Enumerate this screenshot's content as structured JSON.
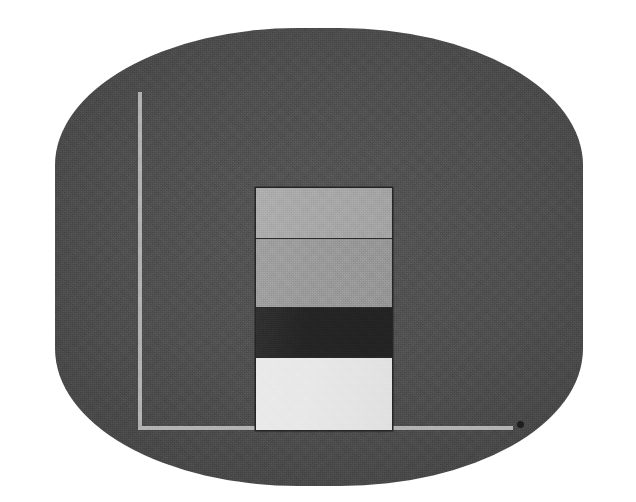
{
  "figure": {
    "title": "",
    "caption": "",
    "medium": "scanned-grayscale-print",
    "panel_color": "#4b4b4b",
    "page_color": "#ffffff"
  },
  "axes": {
    "y_axis_name": "y-axis",
    "x_axis_name": "x-axis",
    "axis_color": "#b3b3b3",
    "y_label": "",
    "x_label": "",
    "y_tick_labels": [],
    "x_tick_labels": [],
    "grid": "off",
    "end_marker_name": "axis-end-dot",
    "end_marker_color": "#1e1e1e"
  },
  "chart_data": {
    "type": "bar",
    "subtype": "stacked",
    "orientation": "vertical",
    "title": "",
    "xlabel": "",
    "ylabel": "",
    "grid": false,
    "legend": "none",
    "categories": [
      "1"
    ],
    "stack_order": "top-to-bottom",
    "series": [
      {
        "name": "segment-1",
        "label": "",
        "color": "#a9a9a9",
        "values": [
          50
        ],
        "pixel_top": 188,
        "pixel_bottom": 238
      },
      {
        "name": "segment-2",
        "label": "",
        "color": "#9b9b9b",
        "values": [
          68
        ],
        "pixel_top": 238,
        "pixel_bottom": 306
      },
      {
        "name": "segment-3",
        "label": "",
        "color": "#242424",
        "values": [
          49
        ],
        "pixel_top": 306,
        "pixel_bottom": 355
      },
      {
        "name": "segment-4",
        "label": "",
        "color": "#e9e9e9",
        "values": [
          72
        ],
        "pixel_top": 355,
        "pixel_bottom": 427
      }
    ],
    "total": 239,
    "ylim": [
      0,
      336
    ],
    "xlim": [
      0,
      375
    ],
    "bar_left_px": 256,
    "bar_right_px": 392,
    "bar_width_px": 136,
    "baseline_px": 427,
    "outline_color": "#262626"
  }
}
